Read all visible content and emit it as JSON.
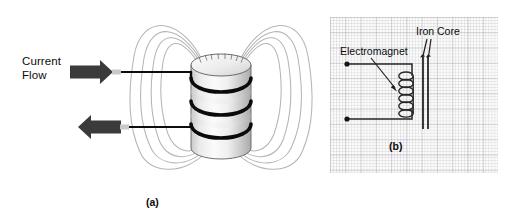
{
  "figure": {
    "panels": [
      {
        "id": "a",
        "caption": "(a)",
        "type": "pictorial-illustration",
        "description": "Coil of wire (solenoid) with surrounding magnetic field lines and current flow arrows",
        "labels": {
          "current_flow": "Current\nFlow"
        },
        "elements": {
          "field_line_count_per_side": 4,
          "coil_turn_count": 3,
          "arrow_count": 2,
          "arrow_directions": [
            "right",
            "left"
          ]
        },
        "colors": {
          "field_line": "#b4b4b4",
          "coil_wire": "#111111",
          "arrow_fill": "#3a3a3a",
          "cylinder_light": "#f2f2f2",
          "cylinder_shadow": "#b9b9b9",
          "text": "#0b0b0b"
        }
      },
      {
        "id": "b",
        "caption": "(b)",
        "type": "schematic-diagram",
        "description": "Circuit schematic of an electromagnet coil drawn on graph paper with an iron core",
        "labels": {
          "electromagnet": "Electromagnet",
          "iron_core": "Iron Core"
        },
        "elements": {
          "coil_loop_count": 6,
          "terminal_dot_count": 2,
          "iron_core_line_count": 2,
          "pointer_arrow_count": 3
        },
        "colors": {
          "grid_major": "#96969b",
          "grid_minor": "#b9b9be",
          "paper": "#fbfbfb",
          "ink": "#222222",
          "text": "#0b0b0b"
        }
      }
    ]
  }
}
